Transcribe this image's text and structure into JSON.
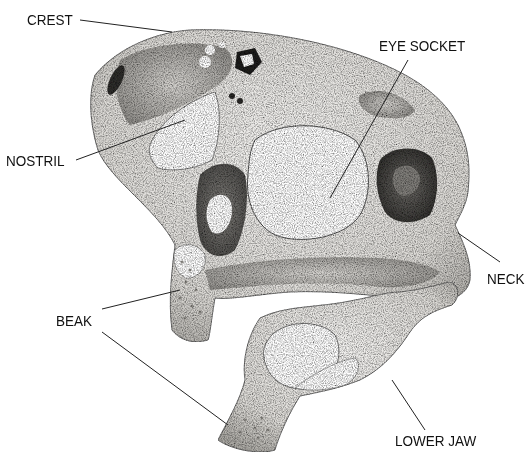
{
  "diagram": {
    "labels": [
      {
        "id": "crest",
        "text": "CREST"
      },
      {
        "id": "eye_socket",
        "text": "EYE SOCKET"
      },
      {
        "id": "nostril",
        "text": "NOSTRIL"
      },
      {
        "id": "beak",
        "text": "BEAK"
      },
      {
        "id": "neck",
        "text": "NECK"
      },
      {
        "id": "lower_jaw",
        "text": "LOWER JAW"
      }
    ],
    "colors": {
      "background": "#ffffff",
      "bone": "#ecebe8",
      "bone_shade": "#9a9893",
      "dark_cavity": "#3b3a37",
      "line": "#222222",
      "text": "#111111"
    }
  }
}
